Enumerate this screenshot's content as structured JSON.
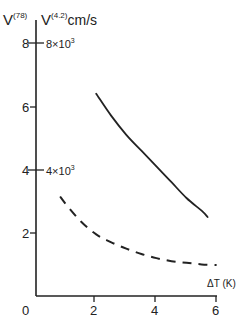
{
  "chart_data": {
    "type": "line",
    "title": "",
    "xlabel": "ΔT (K)",
    "ylabel_left": "V(78)",
    "ylabel_right": "V(4.2) cm/s",
    "xlim": [
      0,
      6
    ],
    "ylim": [
      0,
      8
    ],
    "x_ticks": [
      0,
      2,
      4,
      6
    ],
    "y_ticks": [
      2,
      4,
      6,
      8
    ],
    "y_tick_labels_left": [
      "2",
      "4",
      "6",
      "8"
    ],
    "y_tick_labels_right": {
      "4": "4×10³",
      "8": "8×10³"
    },
    "grid": false,
    "legend": "none",
    "series": [
      {
        "name": "V(4.2)",
        "style": "solid",
        "x": [
          2.0,
          2.5,
          3.0,
          3.5,
          4.0,
          4.5,
          5.0,
          5.5,
          5.7
        ],
        "y": [
          6.4,
          5.7,
          5.1,
          4.6,
          4.1,
          3.6,
          3.1,
          2.7,
          2.5
        ]
      },
      {
        "name": "V(78)",
        "style": "dashed",
        "x": [
          0.8,
          1.0,
          1.5,
          2.0,
          2.5,
          3.0,
          3.5,
          4.0,
          4.5,
          5.0,
          5.5,
          6.0
        ],
        "y": [
          3.15,
          2.9,
          2.35,
          1.95,
          1.7,
          1.5,
          1.33,
          1.2,
          1.1,
          1.05,
          1.0,
          0.98
        ]
      }
    ]
  },
  "labels": {
    "y_left_title_main": "V",
    "y_left_title_sup": "(78)",
    "y_right_title_main": "V",
    "y_right_title_sup": "(4.2)",
    "y_right_title_unit": "cm/s",
    "x_title": "ΔT (K)",
    "origin": "0",
    "x_tick_2": "2",
    "x_tick_4": "4",
    "x_tick_6": "6",
    "y_tick_2": "2",
    "y_tick_4": "4",
    "y_tick_6": "6",
    "y_tick_8": "8",
    "y_right_4_base": "4×10",
    "y_right_4_exp": "3",
    "y_right_8_base": "8×10",
    "y_right_8_exp": "3"
  },
  "colors": {
    "ink": "#222222",
    "background": "#ffffff"
  }
}
